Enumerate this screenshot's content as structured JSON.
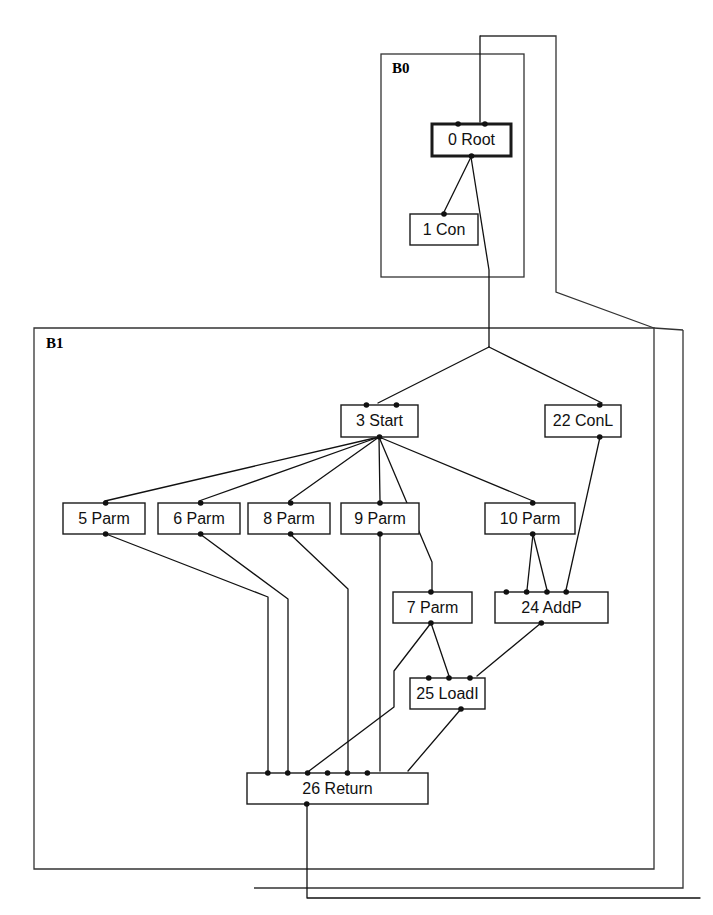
{
  "figure": {
    "type": "compiler-ideal-graph",
    "background_color": "#ffffff",
    "line_color": "#111111",
    "box_fill": "#ffffff"
  },
  "blocks": [
    {
      "id": "B0",
      "label": "B0",
      "label_x": 392,
      "label_y": 70,
      "rect": {
        "x": 381,
        "y": 54,
        "w": 143,
        "h": 223
      }
    },
    {
      "id": "B1",
      "label": "B1",
      "label_x": 46,
      "label_y": 345,
      "rect": {
        "x": 34,
        "y": 328,
        "w": 620,
        "h": 541
      }
    }
  ],
  "nodes": [
    {
      "id": "0",
      "label": "0 Root",
      "x": 432,
      "y": 124,
      "w": 79,
      "h": 32,
      "bold": true,
      "in_ports": [
        0.33,
        0.67
      ],
      "out_ports": [
        0.5
      ]
    },
    {
      "id": "1",
      "label": "1 Con",
      "x": 410,
      "y": 214,
      "w": 68,
      "h": 31,
      "bold": false,
      "in_ports": [
        0.5
      ],
      "out_ports": []
    },
    {
      "id": "3",
      "label": "3 Start",
      "x": 341,
      "y": 405,
      "w": 77,
      "h": 32,
      "bold": false,
      "in_ports": [
        0.33,
        0.72
      ],
      "out_ports": [
        0.5
      ]
    },
    {
      "id": "22",
      "label": "22 ConL",
      "x": 545,
      "y": 405,
      "w": 76,
      "h": 32,
      "bold": false,
      "in_ports": [
        0.72
      ],
      "out_ports": [
        0.72
      ]
    },
    {
      "id": "5",
      "label": "5 Parm",
      "x": 63,
      "y": 503,
      "w": 82,
      "h": 31,
      "bold": false,
      "in_ports": [
        0.52
      ],
      "out_ports": [
        0.52
      ]
    },
    {
      "id": "6",
      "label": "6 Parm",
      "x": 158,
      "y": 503,
      "w": 82,
      "h": 31,
      "bold": false,
      "in_ports": [
        0.52
      ],
      "out_ports": [
        0.52
      ]
    },
    {
      "id": "8",
      "label": "8 Parm",
      "x": 248,
      "y": 503,
      "w": 82,
      "h": 31,
      "bold": false,
      "in_ports": [
        0.52
      ],
      "out_ports": [
        0.52
      ]
    },
    {
      "id": "9",
      "label": "9 Parm",
      "x": 341,
      "y": 503,
      "w": 78,
      "h": 31,
      "bold": false,
      "in_ports": [
        0.5
      ],
      "out_ports": [
        0.5
      ]
    },
    {
      "id": "10",
      "label": "10 Parm",
      "x": 485,
      "y": 503,
      "w": 90,
      "h": 31,
      "bold": false,
      "in_ports": [
        0.53
      ],
      "out_ports": [
        0.53
      ]
    },
    {
      "id": "7",
      "label": "7 Parm",
      "x": 393,
      "y": 592,
      "w": 79,
      "h": 31,
      "bold": false,
      "in_ports": [
        0.48
      ],
      "out_ports": [
        0.48
      ]
    },
    {
      "id": "24",
      "label": "24 AddP",
      "x": 495,
      "y": 592,
      "w": 113,
      "h": 31,
      "bold": false,
      "in_ports": [
        0.1,
        0.28,
        0.46,
        0.63
      ],
      "out_ports": [
        0.41
      ]
    },
    {
      "id": "25",
      "label": "25 LoadI",
      "x": 410,
      "y": 678,
      "w": 75,
      "h": 31,
      "bold": false,
      "in_ports": [
        0.25,
        0.52,
        0.8
      ],
      "out_ports": [
        0.68
      ]
    },
    {
      "id": "26",
      "label": "26 Return",
      "x": 247,
      "y": 773,
      "w": 181,
      "h": 31,
      "bold": false,
      "in_ports": [
        0.115,
        0.225,
        0.335,
        0.445,
        0.555,
        0.665
      ],
      "out_ports": [
        0.33
      ]
    }
  ],
  "edges": [
    {
      "from": "root-external-top",
      "to": "0-in-1",
      "points": "480,120 480,36 556,36 556,292 608,326"
    },
    {
      "from": "0-out",
      "to": "1-in",
      "points": "471,157 444,213"
    },
    {
      "from": "0-out",
      "to": "3-top",
      "points": "471,157 492,265 492,347 379,404"
    },
    {
      "from": "0-out-branch",
      "to": "22-top",
      "points": "492,347 603,403"
    },
    {
      "from": "3-out",
      "to": "5-in",
      "points": "379,437 106,502"
    },
    {
      "from": "3-out",
      "to": "6-in",
      "points": "379,437 200,502"
    },
    {
      "from": "3-out",
      "to": "8-in",
      "points": "379,437 290,502"
    },
    {
      "from": "3-out",
      "to": "9-in",
      "points": "379,437 380,502"
    },
    {
      "from": "3-out",
      "to": "7-in",
      "points": "379,437 431,560 431,591"
    },
    {
      "from": "3-out",
      "to": "10-in",
      "points": "379,437 533,502"
    },
    {
      "from": "22-out",
      "to": "24-in-4",
      "points": "603,437 566,591"
    },
    {
      "from": "10-out",
      "to": "24-in-2",
      "points": "533,534 527,591"
    },
    {
      "from": "10-out",
      "to": "24-in-3",
      "points": "533,534 547,591"
    },
    {
      "from": "5-out",
      "to": "26-in-3",
      "points": "106,534 268,596 268,772"
    },
    {
      "from": "6-out",
      "to": "26-in-4",
      "points": "200,534 290,598 290,772"
    },
    {
      "from": "8-out",
      "to": "26-in-5",
      "points": "290,534 348,590 348,772"
    },
    {
      "from": "9-out",
      "to": "26-in-6",
      "points": "380,534 380,772"
    },
    {
      "from": "7-out",
      "to": "25-in-2",
      "points": "431,623 448,677"
    },
    {
      "from": "7-out",
      "to": "26-in-2",
      "points": "431,623 393,672 393,706 313,772"
    },
    {
      "from": "24-out",
      "to": "25-in-3",
      "points": "541,623 478,677"
    },
    {
      "from": "25-out",
      "to": "26-in-1",
      "points": "461,709 408,772"
    },
    {
      "from": "26-out",
      "to": "exit",
      "points": "307,804 307,886 683,886 683,326"
    }
  ],
  "outlines": [
    {
      "name": "outer-boundary",
      "points": "480,36 556,36 556,292 654,328"
    },
    {
      "name": "block-b1-exit",
      "points": "654,328 654,869 34,869"
    }
  ]
}
